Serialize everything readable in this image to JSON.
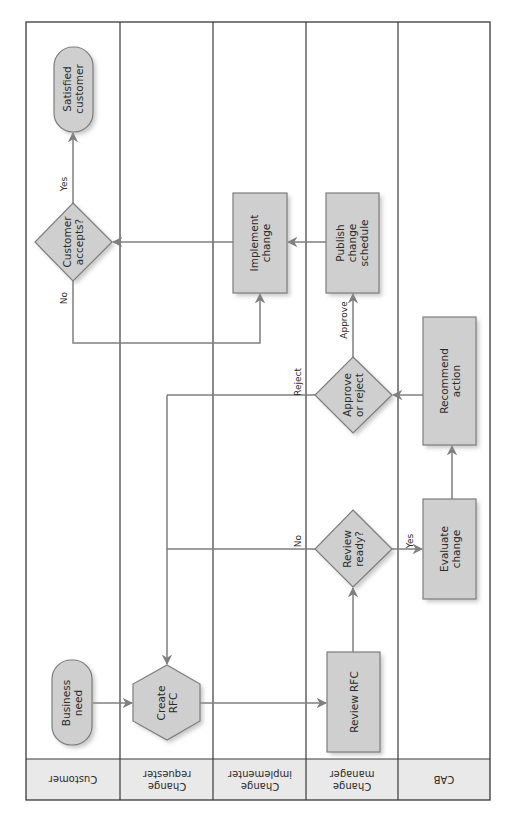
{
  "diagram": {
    "orientation": "rotated-90-ccw",
    "colors": {
      "node_fill": "#cfcfcf",
      "node_stroke": "#7d7d7d",
      "edge": "#7f7f7f",
      "header_fill": "#e9e9e9",
      "frame": "#3a3a3a"
    },
    "lanes": [
      {
        "id": "customer",
        "label": [
          "Customer"
        ]
      },
      {
        "id": "requester",
        "label": [
          "Change",
          "requester"
        ]
      },
      {
        "id": "implementer",
        "label": [
          "Change",
          "implementer"
        ]
      },
      {
        "id": "manager",
        "label": [
          "Change",
          "manager"
        ]
      },
      {
        "id": "cab",
        "label": [
          "CAB"
        ]
      }
    ],
    "nodes": {
      "business_need": {
        "shape": "terminator",
        "lane": "customer",
        "label": [
          "Business",
          "need"
        ]
      },
      "create_rfc": {
        "shape": "hexagon",
        "lane": "requester",
        "label": [
          "Create",
          "RFC"
        ]
      },
      "review_rfc": {
        "shape": "process",
        "lane": "manager",
        "label": [
          "Review RFC"
        ]
      },
      "review_ready": {
        "shape": "decision",
        "lane": "manager",
        "label": [
          "Review",
          "ready?"
        ]
      },
      "evaluate_change": {
        "shape": "process",
        "lane": "cab",
        "label": [
          "Evaluate",
          "change"
        ]
      },
      "recommend_action": {
        "shape": "process",
        "lane": "cab",
        "label": [
          "Recommend",
          "action"
        ]
      },
      "approve_reject": {
        "shape": "decision",
        "lane": "manager",
        "label": [
          "Approve",
          "or reject"
        ]
      },
      "publish_schedule": {
        "shape": "process",
        "lane": "manager",
        "label": [
          "Publish",
          "change",
          "schedule"
        ]
      },
      "implement_change": {
        "shape": "process",
        "lane": "implementer",
        "label": [
          "Implement",
          "change"
        ]
      },
      "customer_accepts": {
        "shape": "decision",
        "lane": "customer",
        "label": [
          "Customer",
          "accepts?"
        ]
      },
      "satisfied_customer": {
        "shape": "terminator",
        "lane": "customer",
        "label": [
          "Satisfied",
          "customer"
        ]
      }
    },
    "edges": [
      {
        "from": "business_need",
        "to": "create_rfc",
        "label": ""
      },
      {
        "from": "create_rfc",
        "to": "review_rfc",
        "label": ""
      },
      {
        "from": "review_rfc",
        "to": "review_ready",
        "label": ""
      },
      {
        "from": "review_ready",
        "to": "evaluate_change",
        "label": "Yes"
      },
      {
        "from": "review_ready",
        "to": "create_rfc",
        "label": "No"
      },
      {
        "from": "evaluate_change",
        "to": "recommend_action",
        "label": ""
      },
      {
        "from": "recommend_action",
        "to": "approve_reject",
        "label": ""
      },
      {
        "from": "approve_reject",
        "to": "publish_schedule",
        "label": "Approve"
      },
      {
        "from": "approve_reject",
        "to": "create_rfc",
        "label": "Reject"
      },
      {
        "from": "publish_schedule",
        "to": "implement_change",
        "label": ""
      },
      {
        "from": "implement_change",
        "to": "customer_accepts",
        "label": ""
      },
      {
        "from": "customer_accepts",
        "to": "satisfied_customer",
        "label": "Yes"
      },
      {
        "from": "customer_accepts",
        "to": "implement_change",
        "label": "No"
      }
    ],
    "edge_labels": {
      "review_yes": "Yes",
      "review_no": "No",
      "approve": "Approve",
      "reject": "Reject",
      "accept_yes": "Yes",
      "accept_no": "No"
    }
  }
}
